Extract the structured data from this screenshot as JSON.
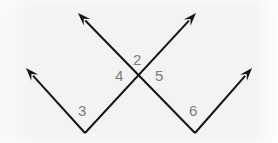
{
  "figure": {
    "name": "intersecting-rays-angle-diagram",
    "background_color": "#f3f3f3",
    "stroke_color": "#141414",
    "label_color": "#7d7d7d",
    "stroke_width": 2,
    "width": 278,
    "height": 143
  },
  "labels": [
    {
      "id": "label-2",
      "text": "2",
      "x": 133,
      "y": 52
    },
    {
      "id": "label-4",
      "text": "4",
      "x": 115,
      "y": 68
    },
    {
      "id": "label-5",
      "text": "5",
      "x": 155,
      "y": 68
    },
    {
      "id": "label-3",
      "text": "3",
      "x": 78,
      "y": 103
    },
    {
      "id": "label-6",
      "text": "6",
      "x": 189,
      "y": 103
    }
  ],
  "rays": [
    {
      "id": "ray-upper-left",
      "description": "ray from lower-right vertex up-left with arrowhead",
      "from": {
        "x": 195,
        "y": 133
      },
      "to": {
        "x": 78,
        "y": 13
      },
      "arrow_at": "to"
    },
    {
      "id": "ray-upper-right",
      "description": "ray from lower-left vertex up-right with arrowhead",
      "from": {
        "x": 85,
        "y": 133
      },
      "to": {
        "x": 196,
        "y": 13
      },
      "arrow_at": "to"
    },
    {
      "id": "ray-left-outer",
      "description": "ray from lower-left vertex up-left with arrowhead",
      "from": {
        "x": 85,
        "y": 133
      },
      "to": {
        "x": 26,
        "y": 68
      },
      "arrow_at": "to"
    },
    {
      "id": "ray-right-outer",
      "description": "ray from lower-right vertex up-right with arrowhead",
      "from": {
        "x": 195,
        "y": 133
      },
      "to": {
        "x": 252,
        "y": 68
      },
      "arrow_at": "to"
    }
  ],
  "vertices": [
    {
      "id": "vertex-intersection",
      "x": 141.5,
      "y": 79
    },
    {
      "id": "vertex-lower-left",
      "x": 85,
      "y": 133
    },
    {
      "id": "vertex-lower-right",
      "x": 195,
      "y": 133
    }
  ]
}
